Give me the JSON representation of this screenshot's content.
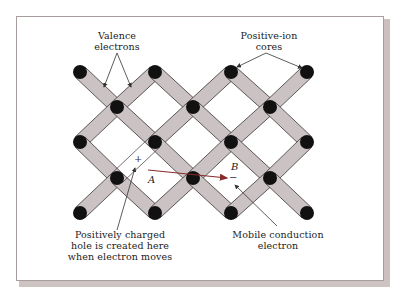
{
  "diagram": {
    "type": "crystal-lattice-bonding",
    "labels": {
      "valence_line1": "Valence",
      "valence_line2": "electrons",
      "ion_line1": "Positive-ion",
      "ion_line2": "cores",
      "hole_line1": "Positively charged",
      "hole_line2": "hole is created here",
      "hole_line3": "when electron moves",
      "mobile_line1": "Mobile conduction",
      "mobile_line2": "electron",
      "point_a": "A",
      "point_b": "B",
      "plus_sign": "+",
      "minus_sign": "−"
    },
    "colors": {
      "bond_fill": "#cbc3c3",
      "bond_edge": "#3a3333",
      "node": "#111111",
      "arrow_motion": "#8a2a2a",
      "pointer": "#333333",
      "frame_shadow": "#cdc3c3"
    },
    "nodes": [
      [
        80,
        72
      ],
      [
        155,
        72
      ],
      [
        231,
        72
      ],
      [
        307,
        72
      ],
      [
        117,
        107
      ],
      [
        193,
        107
      ],
      [
        270,
        107
      ],
      [
        80,
        142
      ],
      [
        155,
        142
      ],
      [
        231,
        142
      ],
      [
        307,
        142
      ],
      [
        117,
        178
      ],
      [
        193,
        178
      ],
      [
        270,
        178
      ],
      [
        80,
        213
      ],
      [
        155,
        213
      ],
      [
        231,
        213
      ],
      [
        307,
        213
      ]
    ],
    "missing_bond": {
      "from": [
        155,
        142
      ],
      "to": [
        117,
        178
      ]
    }
  }
}
